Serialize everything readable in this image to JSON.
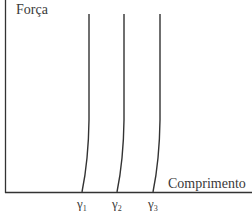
{
  "diagram": {
    "y_axis_label": "Força",
    "x_axis_label": "Comprimento",
    "curves": [
      {
        "label": "γ",
        "subscript": "1"
      },
      {
        "label": "γ",
        "subscript": "2"
      },
      {
        "label": "γ",
        "subscript": "3"
      }
    ],
    "colors": {
      "line": "#333333",
      "text": "#3a3a3a"
    }
  }
}
